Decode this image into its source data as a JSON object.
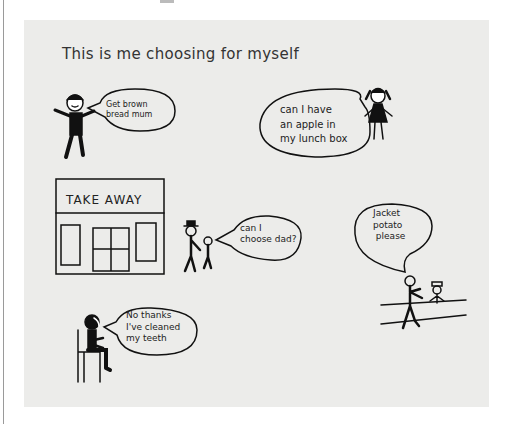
{
  "illustration": {
    "title": "This is me choosing for myself",
    "scenes": [
      {
        "id": "brown-bread",
        "speech": "Get brown\nbread mum"
      },
      {
        "id": "apple",
        "speech": "can I have\nan apple in\nmy lunch box"
      },
      {
        "id": "take-away",
        "sign": "TAKE AWAY",
        "speech": "can I\nchoose dad?"
      },
      {
        "id": "jacket-potato",
        "speech": "Jacket\npotato\n please"
      },
      {
        "id": "no-thanks",
        "speech": "No thanks\nI've cleaned\nmy teeth"
      }
    ]
  }
}
